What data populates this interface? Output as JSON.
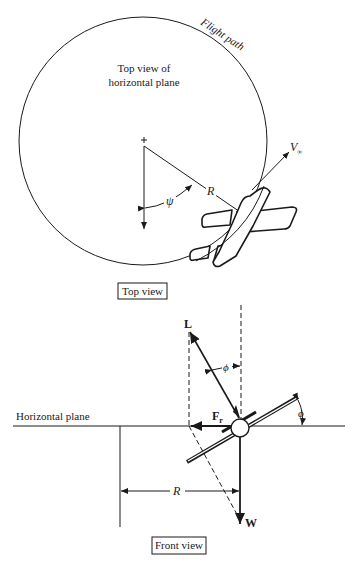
{
  "top_view": {
    "flight_path_label": "Flight path",
    "plane_label_line1": "Top view of",
    "plane_label_line2": "horizontal plane",
    "psi_symbol": "ψ",
    "radius_label": "R",
    "velocity_label": "V",
    "velocity_subscript": "∞",
    "caption": "Top view"
  },
  "front_view": {
    "horizontal_plane_label": "Horizontal plane",
    "lift_label": "L",
    "phi_symbol_top": "ϕ",
    "phi_symbol_right": "ϕ",
    "centripetal_force_label": "F",
    "centripetal_force_subscript": "r",
    "radius_label": "R",
    "weight_label": "W",
    "caption": "Front view"
  },
  "colors": {
    "line": "#1a1a1a",
    "background": "#ffffff"
  }
}
